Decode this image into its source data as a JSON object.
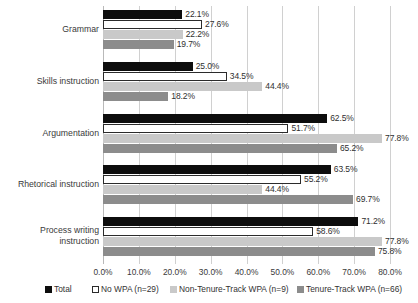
{
  "chart_data": {
    "type": "bar",
    "orientation": "horizontal",
    "title": "",
    "xlabel": "",
    "ylabel": "",
    "xlim": [
      0,
      80
    ],
    "xtick_labels": [
      "0.0%",
      "10.0%",
      "20.0%",
      "30.0%",
      "40.0%",
      "50.0%",
      "60.0%",
      "70.0%",
      "80.0%"
    ],
    "xtick_values": [
      0,
      10,
      20,
      30,
      40,
      50,
      60,
      70,
      80
    ],
    "grid": true,
    "legend_position": "bottom",
    "categories": [
      "Grammar",
      "Skills instruction",
      "Argumentation",
      "Rhetorical instruction",
      "Process writing\ninstruction"
    ],
    "series": [
      {
        "name": "Total",
        "color": "#0d0d0d",
        "values": [
          22.1,
          25.0,
          62.5,
          63.5,
          71.2
        ],
        "labels": [
          "22.1%",
          "25.0%",
          "62.5%",
          "63.5%",
          "71.2%"
        ]
      },
      {
        "name": "No WPA (n=29)",
        "color": "#ffffff",
        "values": [
          27.6,
          34.5,
          51.7,
          55.2,
          58.6
        ],
        "labels": [
          "27.6%",
          "34.5%",
          "51.7%",
          "55.2%",
          "58.6%"
        ]
      },
      {
        "name": "Non-Tenure-Track WPA (n=9)",
        "color": "#c9c9c9",
        "values": [
          22.2,
          44.4,
          77.8,
          44.4,
          77.8
        ],
        "labels": [
          "22.2%",
          "44.4%",
          "77.8%",
          "44.4%",
          "77.8%"
        ]
      },
      {
        "name": "Tenure-Track WPA (n=66)",
        "color": "#8c8c8c",
        "values": [
          19.7,
          18.2,
          65.2,
          69.7,
          75.8
        ],
        "labels": [
          "19.7%",
          "18.2%",
          "65.2%",
          "69.7%",
          "75.8%"
        ]
      }
    ]
  }
}
